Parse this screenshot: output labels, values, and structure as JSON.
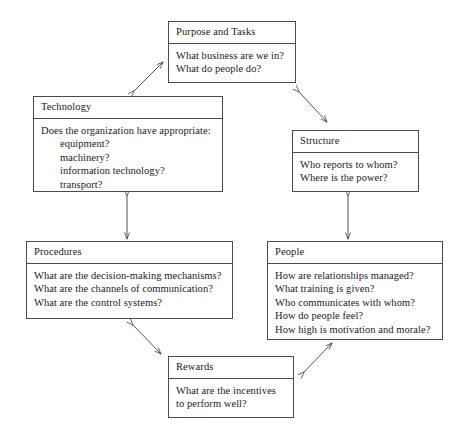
{
  "diagram": {
    "background_color": "#ffffff",
    "line_color": "#4a4a4a",
    "text_color": "#1a1a1a",
    "nodes": [
      {
        "id": "purpose",
        "title": "Purpose and Tasks",
        "lines": [
          {
            "text": "What business are we in?",
            "indent": false
          },
          {
            "text": "What do people do?",
            "indent": false
          }
        ]
      },
      {
        "id": "technology",
        "title": "Technology",
        "lines": [
          {
            "text": "Does the organization have appropriate:",
            "indent": false
          },
          {
            "text": "equipment?",
            "indent": true
          },
          {
            "text": "machinery?",
            "indent": true
          },
          {
            "text": "information technology?",
            "indent": true
          },
          {
            "text": "transport?",
            "indent": true
          }
        ]
      },
      {
        "id": "structure",
        "title": "Structure",
        "lines": [
          {
            "text": "Who reports to whom?",
            "indent": false
          },
          {
            "text": "Where is the power?",
            "indent": false
          }
        ]
      },
      {
        "id": "procedures",
        "title": "Procedures",
        "lines": [
          {
            "text": "What are the decision-making mechanisms?",
            "indent": false
          },
          {
            "text": "What are the channels of communication?",
            "indent": false
          },
          {
            "text": "What are the control systems?",
            "indent": false
          }
        ]
      },
      {
        "id": "people",
        "title": "People",
        "lines": [
          {
            "text": "How are relationships managed?",
            "indent": false
          },
          {
            "text": "What training is given?",
            "indent": false
          },
          {
            "text": "Who communicates with whom?",
            "indent": false
          },
          {
            "text": "How do people feel?",
            "indent": false
          },
          {
            "text": "How high is motivation and morale?",
            "indent": false
          }
        ]
      },
      {
        "id": "rewards",
        "title": "Rewards",
        "lines": [
          {
            "text": "What are the incentives",
            "indent": false
          },
          {
            "text": "to perform well?",
            "indent": false
          }
        ]
      }
    ],
    "connectors": [
      {
        "id": "technology-purpose",
        "from": "technology",
        "to": "purpose",
        "style": "double-headed-diagonal"
      },
      {
        "id": "purpose-structure",
        "from": "purpose",
        "to": "structure",
        "style": "double-headed-diagonal"
      },
      {
        "id": "technology-procedures",
        "from": "technology",
        "to": "procedures",
        "style": "double-headed-vertical"
      },
      {
        "id": "structure-people",
        "from": "structure",
        "to": "people",
        "style": "double-headed-vertical"
      },
      {
        "id": "procedures-rewards",
        "from": "procedures",
        "to": "rewards",
        "style": "double-headed-diagonal"
      },
      {
        "id": "rewards-people",
        "from": "rewards",
        "to": "people",
        "style": "double-headed-diagonal"
      }
    ]
  }
}
